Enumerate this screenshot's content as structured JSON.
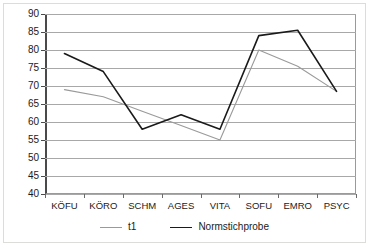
{
  "chart_data": {
    "type": "line",
    "title": "",
    "subtitle": "",
    "xlabel": "",
    "ylabel": "",
    "categories": [
      "KÖFU",
      "KÖRO",
      "SCHM",
      "AGES",
      "VITA",
      "SOFU",
      "EMRO",
      "PSYC"
    ],
    "series": [
      {
        "name": "t1",
        "color": "#9a9a9a",
        "values": [
          69,
          67,
          63,
          59,
          55,
          80,
          75.5,
          68.5
        ]
      },
      {
        "name": "Normstichprobe",
        "color": "#1a1a1a",
        "values": [
          79,
          74,
          58,
          62,
          58,
          84,
          85.5,
          68.5
        ]
      }
    ],
    "ylim": [
      40,
      90
    ],
    "yticks": [
      40,
      45,
      50,
      55,
      60,
      65,
      70,
      75,
      80,
      85,
      90
    ],
    "ytick_labels": [
      "40",
      "45",
      "50",
      "55",
      "60",
      "65",
      "70",
      "75",
      "80",
      "85",
      "90"
    ],
    "grid": true,
    "grid_axis": "y",
    "legend_position": "bottom",
    "legend_entries": [
      "t1",
      "Normstichprobe"
    ]
  },
  "colors": {
    "grid": "#a8a8a8",
    "axis": "#4a4a4a",
    "plot_border": "#9a9a9a",
    "frame_border": "#dcdcd8",
    "background": "#ffffff",
    "text": "#1a1a1a"
  }
}
